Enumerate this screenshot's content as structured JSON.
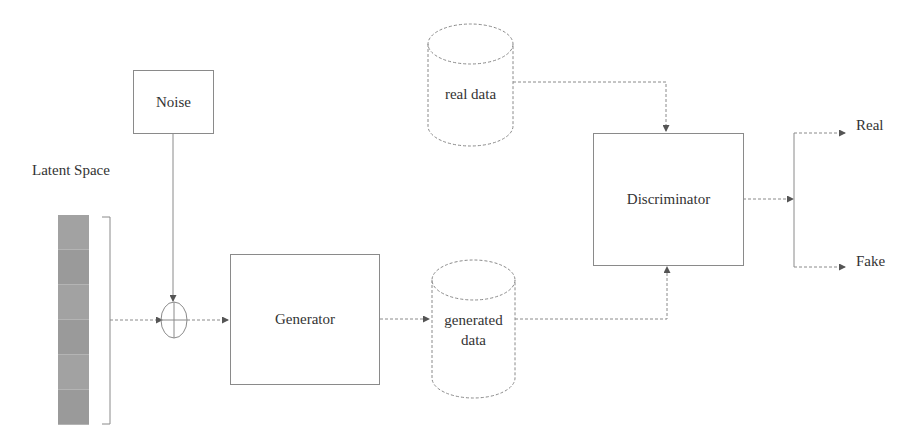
{
  "diagram": {
    "nodes": {
      "latent_space": {
        "label": "Latent Space",
        "cells": 6
      },
      "noise": {
        "label": "Noise"
      },
      "combiner": {
        "symbol": "⊕",
        "type": "sum"
      },
      "generator": {
        "label": "Generator"
      },
      "real_data": {
        "label": "real data",
        "shape": "cylinder"
      },
      "generated_data": {
        "label_line1": "generated",
        "label_line2": "data",
        "shape": "cylinder"
      },
      "discriminator": {
        "label": "Discriminator"
      },
      "output_real": {
        "label": "Real"
      },
      "output_fake": {
        "label": "Fake"
      }
    },
    "edges": [
      {
        "from": "latent_space",
        "to": "combiner"
      },
      {
        "from": "noise",
        "to": "combiner"
      },
      {
        "from": "combiner",
        "to": "generator"
      },
      {
        "from": "generator",
        "to": "generated_data"
      },
      {
        "from": "real_data",
        "to": "discriminator"
      },
      {
        "from": "generated_data",
        "to": "discriminator"
      },
      {
        "from": "discriminator",
        "to": "output_real"
      },
      {
        "from": "discriminator",
        "to": "output_fake"
      }
    ],
    "colors": {
      "stroke": "#8a8a8a",
      "latent_fill": "#9e9e9e",
      "text": "#333333"
    }
  }
}
